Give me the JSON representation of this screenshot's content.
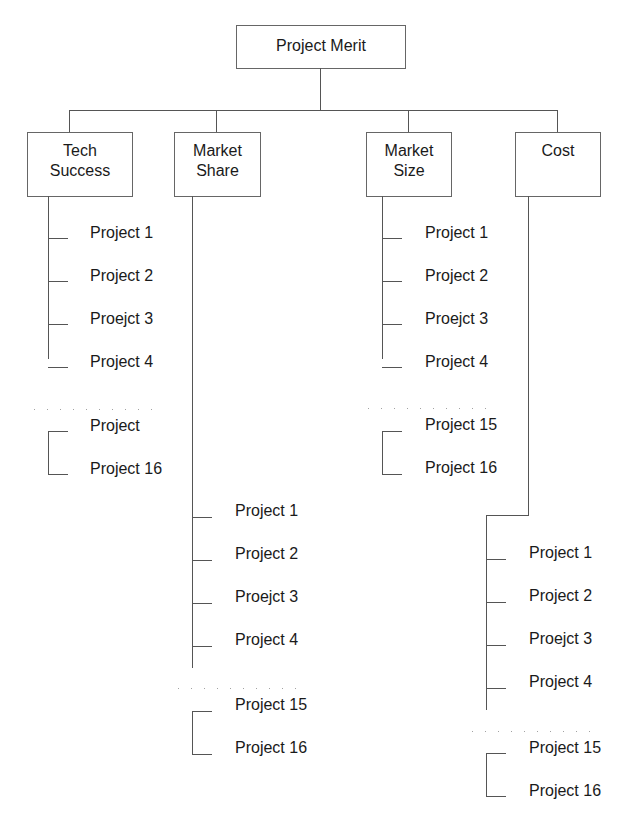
{
  "root": {
    "label": "Project Merit"
  },
  "categories": [
    {
      "line1": "Tech",
      "line2": "Success",
      "items": [
        "Project 1",
        "Project 2",
        "Proejct 3",
        "Project 4",
        "Project",
        "Project 16"
      ]
    },
    {
      "line1": "Market",
      "line2": "Share",
      "items": [
        "Project 1",
        "Project 2",
        "Proejct 3",
        "Project 4",
        "Project 15",
        "Project 16"
      ]
    },
    {
      "line1": "Market",
      "line2": "Size",
      "items": [
        "Project 1",
        "Project 2",
        "Proejct 3",
        "Project 4",
        "Project 15",
        "Project 16"
      ]
    },
    {
      "line1": "Cost",
      "line2": "",
      "items": [
        "Project 1",
        "Project 2",
        "Proejct 3",
        "Project 4",
        "Project 15",
        "Project 16"
      ]
    }
  ],
  "ellipsis": ". . . . . . . . . . ."
}
